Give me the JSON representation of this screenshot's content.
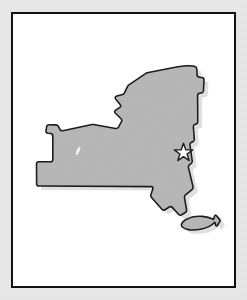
{
  "figure": {
    "kind": "state-outline-map",
    "subject": "New York",
    "description": "Gray silhouette map of New York State with a white star marking the capital location, drawn inside a thin black rectangular frame on white background."
  },
  "frame": {
    "border_color": "#111111",
    "border_width_px": 2,
    "fill_color": "#ffffff",
    "x": 11,
    "y": 12,
    "width": 225,
    "height": 276
  },
  "canvas": {
    "background_color": "#e9e9e9",
    "width": 247,
    "height": 300
  },
  "state_shape": {
    "name": "new-york-outline",
    "fill_color": "#b9b9b9",
    "stroke_color": "#1b1b1b",
    "stroke_width_px": 1.6,
    "shadow_color": "#cfcfcf"
  },
  "mainland_path": "M183.5,66.0 C188.2,65.6 192.6,65.8 195.0,66.6 C196.3,67.1 196.8,68.0 196.9,69.6 L197.0,74.6 C197.1,76.2 197.9,77.0 199.6,77.2 L202.0,77.5 C203.4,77.7 204.1,78.5 204.0,80.0 L203.5,90.5 C203.4,92.0 202.7,92.8 201.3,93.0 L199.5,93.3 C198.2,93.5 197.6,94.3 197.6,95.7 L197.8,121.5 C197.8,122.8 197.4,123.6 196.3,124.0 L194.8,124.6 C193.7,125.0 193.3,125.8 193.4,127.1 L194.3,139.0 C194.4,140.3 194.0,141.2 192.9,141.7 L191.3,142.4 C190.2,142.9 189.8,143.8 190.0,145.1 L192.2,160.5 C192.4,161.8 192.1,162.7 191.2,163.4 L189.4,164.8 C188.5,165.5 188.2,166.4 188.5,167.6 L193.0,186.5 C193.3,187.8 193.0,188.8 192.0,189.6 L185.6,194.8 C184.7,195.5 184.3,196.4 184.5,197.6 L186.6,209.8 C186.8,211.0 186.4,211.9 185.4,212.5 L181.6,214.8 C180.5,215.5 179.4,215.3 178.5,214.3 L172.2,207.4 C171.4,206.5 170.3,206.4 169.3,207.0 L165.0,209.7 C163.9,210.4 162.8,210.2 161.9,209.2 L151.5,197.5 C150.7,196.6 150.5,195.6 150.9,194.4 L152.8,189.0 C153.3,187.6 152.8,186.7 151.3,186.6 L38.9,186.0 C37.4,186.0 36.6,185.2 36.6,183.7 L36.5,164.0 C36.5,162.5 37.3,161.7 38.8,161.7 L50.5,161.8 C52.0,161.8 52.8,161.0 52.8,159.5 L52.8,135.9 C52.8,134.5 52.1,133.7 50.7,133.5 L47.8,133.2 C46.4,133.0 45.8,132.2 46.0,130.8 L46.6,126.8 C46.8,125.5 47.6,124.8 48.9,124.8 L56.0,124.9 C57.1,124.9 57.9,125.4 58.4,126.4 L59.9,129.4 C60.5,130.6 61.4,131.0 62.7,130.7 L92.0,124.5 C92.6,124.4 93.1,124.4 93.7,124.5 L115.6,128.5 C116.9,128.7 117.9,128.3 118.5,127.2 L121.5,121.5 C122.0,120.5 121.8,119.6 121.0,118.8 L115.4,113.3 C114.3,112.2 114.4,111.0 115.7,110.1 L119.7,107.4 C120.9,106.6 121.0,105.6 120.1,104.5 L115.8,99.3 C114.7,97.9 115.1,96.6 116.8,96.1 L122.6,94.4 C123.4,94.2 124.0,93.7 124.4,92.9 L127.6,86.3 C127.9,85.7 128.3,85.2 128.9,84.8 L145.5,73.6 C146.0,73.3 146.5,73.0 147.1,72.8 L176.4,67.0 C178.8,66.5 181.1,66.2 183.5,66.0 Z",
  "long_island_path": "M186.0,219.5 C190.5,217.0 196.5,215.8 202.5,216.4 C206.8,216.8 210.6,217.9 213.5,219.3 L214.6,216.0 C214.9,215.1 215.7,214.9 216.3,215.6 L219.8,219.6 C220.2,220.1 220.3,220.6 220.0,221.1 L217.4,225.5 C216.9,226.3 216.0,226.2 215.7,225.2 L214.8,222.2 C212.0,225.3 206.8,228.0 200.5,229.3 C192.8,230.9 185.4,229.9 182.4,227.0 C180.3,225.0 181.8,221.8 186.0,219.5 Z",
  "lake_spot": {
    "name": "small-white-lake-mark",
    "cx": 78,
    "cy": 151,
    "rx": 1.6,
    "ry": 4.2,
    "rotation_deg": 20,
    "fill_color": "#f2f2f2"
  },
  "capital_star": {
    "name": "capital-star-marker",
    "label": "Albany",
    "cx": 183.5,
    "cy": 152.5,
    "outer_radius": 9.2,
    "inner_radius": 3.8,
    "fill_color": "#ffffff",
    "stroke_color": "#1b1b1b",
    "stroke_width_px": 1.4
  }
}
